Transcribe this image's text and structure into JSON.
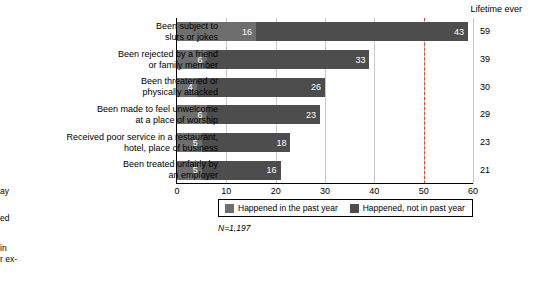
{
  "margin_fragments": [
    {
      "text": "ay",
      "top": 186
    },
    {
      "text": "ed",
      "top": 213
    },
    {
      "text": "in",
      "top": 243
    },
    {
      "text": "r ex-",
      "top": 254
    }
  ],
  "chart_data": {
    "type": "bar",
    "orientation": "horizontal",
    "stacked": true,
    "title": "",
    "xlabel": "",
    "ylabel": "",
    "xlim": [
      0,
      60
    ],
    "xticks": [
      0,
      10,
      20,
      30,
      40,
      50,
      60
    ],
    "grid": true,
    "legend_position": "bottom",
    "right_column_header": "Lifetime ever",
    "note": "N=1,197",
    "dashed_reference_line": 50,
    "series": [
      {
        "name": "Happened in the past year",
        "color": "#6e6e6e",
        "values": [
          16,
          6,
          4,
          6,
          5,
          5
        ]
      },
      {
        "name": "Happened, not in past year",
        "color": "#4d4d4d",
        "values": [
          43,
          33,
          26,
          23,
          18,
          16
        ]
      }
    ],
    "categories": [
      "Been subject to\nslurs or jokes",
      "Been rejected by a friend\nor family member",
      "Been threatened or\nphysically attacked",
      "Been made to feel unwelcome\nat a place of worship",
      "Received poor service in a restaurant,\nhotel, place of business",
      "Been treated unfairly by\nan employer"
    ],
    "totals": [
      59,
      39,
      30,
      29,
      23,
      21
    ]
  }
}
